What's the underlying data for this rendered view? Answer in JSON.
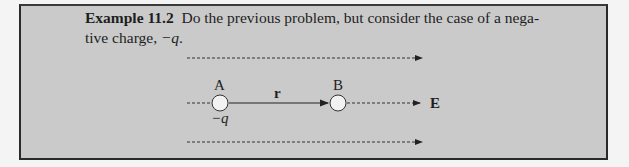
{
  "example": {
    "label": "Example 11.2",
    "text_line1": "Do the previous problem, but consider the case of a nega-",
    "text_line2_prefix": "tive charge, ",
    "text_line2_charge": "−q",
    "text_line2_suffix": "."
  },
  "diagram": {
    "point_a_label": "A",
    "point_b_label": "B",
    "charge_label": "−q",
    "vector_label": "r",
    "field_label": "E"
  }
}
